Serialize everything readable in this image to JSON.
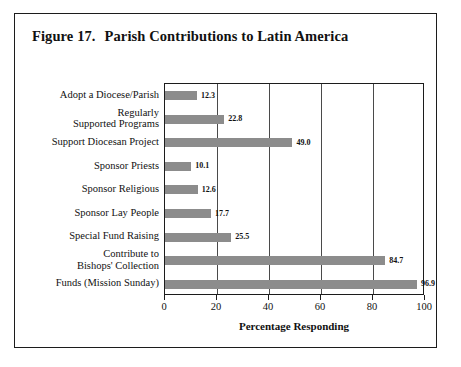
{
  "figure": {
    "number": "Figure 17.",
    "title": "Parish Contributions to Latin America"
  },
  "chart_data": {
    "type": "bar",
    "orientation": "horizontal",
    "xlabel": "Percentage Responding",
    "ylabel": "",
    "xlim": [
      0,
      100
    ],
    "xticks": [
      "0",
      "20",
      "40",
      "60",
      "80",
      "100"
    ],
    "grid": "vertical",
    "legend": "none",
    "bar_color": "#8c8c8c",
    "categories": [
      "Adopt a Diocese/Parish",
      "Regularly\nSupported Programs",
      "Support Diocesan Project",
      "Sponsor Priests",
      "Sponsor Religious",
      "Sponsor Lay People",
      "Special Fund Raising",
      "Contribute to\nBishops' Collection",
      "Funds (Mission Sunday)"
    ],
    "values": [
      12.3,
      22.8,
      49.0,
      10.1,
      12.6,
      17.7,
      25.5,
      84.7,
      96.9
    ],
    "value_labels": [
      "12.3",
      "22.8",
      "49.0",
      "10.1",
      "12.6",
      "17.7",
      "25.5",
      "84.7",
      "96.9"
    ]
  }
}
